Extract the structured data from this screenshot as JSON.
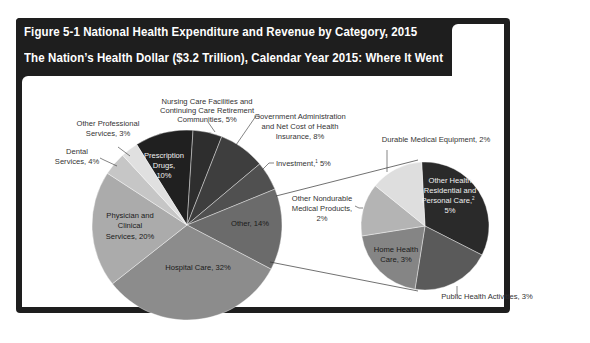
{
  "header": {
    "figure_title": "Figure 5-1    National Health Expenditure and Revenue by Category, 2015",
    "subtitle": "The Nation’s Health Dollar ($3.2 Trillion), Calendar Year 2015: Where It Went"
  },
  "chart_data": [
    {
      "type": "pie",
      "title": "The Nation’s Health Dollar ($3.2 Trillion), Calendar Year 2015: Where It Went",
      "categories": [
        "Prescription Drugs",
        "Nursing Care Facilities and Continuing Care Retirement Communities",
        "Government Administration and Net Cost of Health Insurance",
        "Investment",
        "Other",
        "Hospital Care",
        "Physician and Clinical Services",
        "Dental Services",
        "Other Professional Services"
      ],
      "values": [
        10,
        5,
        8,
        5,
        14,
        32,
        20,
        4,
        3
      ],
      "colors": [
        "#202020",
        "#2e2e2e",
        "#3e3e3e",
        "#505050",
        "#6b6b6b",
        "#8c8c8c",
        "#ababab",
        "#c6c6c6",
        "#e0e0e0"
      ],
      "labels": {
        "prescription": [
          "Prescription",
          "Drugs,",
          "10%"
        ],
        "nursing": [
          "Nursing Care Facilities and",
          "Continuing Care Retirement",
          "Communities, 5%"
        ],
        "gov": [
          "Government Administration",
          "and Net Cost of Health",
          "Insurance, 8%"
        ],
        "investment": "Investment,",
        "investment_sup": "1",
        "investment_pct": " 5%",
        "other": "Other, 14%",
        "hospital": "Hospital Care, 32%",
        "physician": [
          "Physician and",
          "Clinical",
          "Services, 20%"
        ],
        "dental": [
          "Dental",
          "Services, 4%"
        ],
        "other_prof": [
          "Other Professional",
          "Services, 3%"
        ]
      }
    },
    {
      "type": "pie",
      "title": "Other, 14% (breakdown)",
      "categories": [
        "Other Health Residential and Personal Care",
        "Public Health Activities",
        "Home Health Care",
        "Other Nondurable Medical Products",
        "Durable Medical Equipment"
      ],
      "values": [
        5,
        3,
        3,
        2,
        2
      ],
      "colors": [
        "#2a2a2a",
        "#5a5a5a",
        "#858585",
        "#b4b4b4",
        "#dedede"
      ],
      "labels": {
        "residential": [
          "Other Health",
          "Residential and",
          "Personal Care,",
          "5%"
        ],
        "residential_sup": "2",
        "public_health": "Public Health Activities, 3%",
        "home_health": [
          "Home Health",
          "Care, 3%"
        ],
        "nondurable": [
          "Other Nondurable",
          "Medical Products,",
          "2%"
        ],
        "durable": "Durable Medical Equipment, 2%"
      }
    }
  ]
}
